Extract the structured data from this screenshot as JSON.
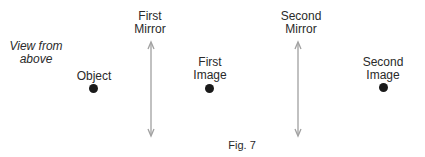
{
  "figure": {
    "caption": "Fig. 7",
    "view_note": [
      "View from",
      "above"
    ],
    "object": {
      "label": "Object"
    },
    "first_mirror": {
      "label": [
        "First",
        "Mirror"
      ]
    },
    "first_image": {
      "label": [
        "First",
        "Image"
      ]
    },
    "second_mirror": {
      "label": [
        "Second",
        "Mirror"
      ]
    },
    "second_image": {
      "label": [
        "Second",
        "Image"
      ]
    },
    "colors": {
      "mirror": "#a0a0a0",
      "dot": "#1a1a1a",
      "text": "#2a2a2a"
    }
  }
}
